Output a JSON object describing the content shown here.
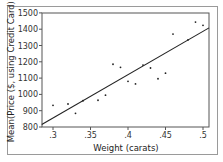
{
  "chart_data": {
    "type": "scatter",
    "title": "",
    "xlabel": "Weight (carats)",
    "ylabel": "Mean(Price ($, using Credit Card))",
    "xlim": [
      0.285,
      0.51
    ],
    "ylim": [
      800,
      1500
    ],
    "x_ticks": [
      ".3",
      ".35",
      ".4",
      ".45",
      ".5"
    ],
    "y_ticks": [
      "800",
      "900",
      "1000",
      "1100",
      "1200",
      "1300",
      "1400",
      "1500"
    ],
    "grid": false,
    "legend": null,
    "points": [
      {
        "x": 0.3,
        "y": 933
      },
      {
        "x": 0.32,
        "y": 941
      },
      {
        "x": 0.33,
        "y": 884
      },
      {
        "x": 0.34,
        "y": 961
      },
      {
        "x": 0.36,
        "y": 964
      },
      {
        "x": 0.37,
        "y": 995
      },
      {
        "x": 0.38,
        "y": 1185
      },
      {
        "x": 0.39,
        "y": 1166
      },
      {
        "x": 0.4,
        "y": 1080
      },
      {
        "x": 0.41,
        "y": 1064
      },
      {
        "x": 0.42,
        "y": 1180
      },
      {
        "x": 0.43,
        "y": 1162
      },
      {
        "x": 0.44,
        "y": 1096
      },
      {
        "x": 0.45,
        "y": 1130
      },
      {
        "x": 0.46,
        "y": 1370
      },
      {
        "x": 0.48,
        "y": 1334
      },
      {
        "x": 0.49,
        "y": 1444
      },
      {
        "x": 0.5,
        "y": 1424
      }
    ],
    "fit_line": {
      "x": [
        0.285,
        0.508
      ],
      "y": [
        815,
        1408
      ]
    }
  }
}
